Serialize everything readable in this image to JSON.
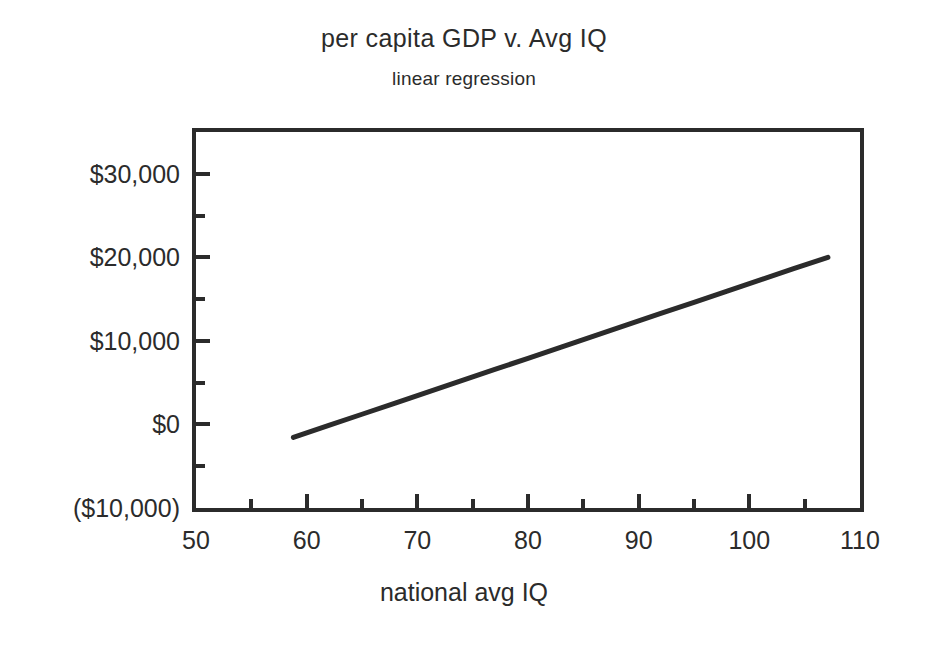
{
  "chart_data": {
    "type": "line",
    "title": "per capita GDP v. Avg IQ",
    "subtitle": "linear regression",
    "xlabel": "national avg IQ",
    "ylabel": "",
    "xlim": [
      50,
      110
    ],
    "ylim": [
      -10000,
      35000
    ],
    "grid": false,
    "legend": null,
    "xticks": [
      50,
      60,
      70,
      80,
      90,
      100,
      110
    ],
    "xtick_labels": [
      "50",
      "60",
      "70",
      "80",
      "90",
      "100",
      "110"
    ],
    "xminor_ticks": [
      55,
      65,
      75,
      85,
      95,
      105
    ],
    "yticks": [
      30000,
      20000,
      10000,
      0,
      -10000
    ],
    "ytick_labels": [
      "$30,000",
      "$20,000",
      "$10,000",
      "$0",
      "($10,000)"
    ],
    "yminor_ticks": [
      25000,
      15000,
      5000,
      -5000
    ],
    "series": [
      {
        "name": "linear regression",
        "color": "#2b2b2b",
        "x": [
          58.8,
          62.0,
          65.0,
          68.0,
          71.0,
          74.0,
          77.0,
          80.0,
          83.0,
          86.0,
          89.0,
          92.0,
          95.0,
          98.0,
          101.0,
          104.0,
          107.1
        ],
        "values": [
          -1560,
          -120,
          1220,
          2560,
          3900,
          5240,
          6580,
          7920,
          9260,
          10600,
          11940,
          13280,
          14620,
          15960,
          17300,
          18640,
          20000
        ]
      }
    ]
  },
  "colors": {
    "ink": "#2b2b2b",
    "background": "#ffffff"
  }
}
